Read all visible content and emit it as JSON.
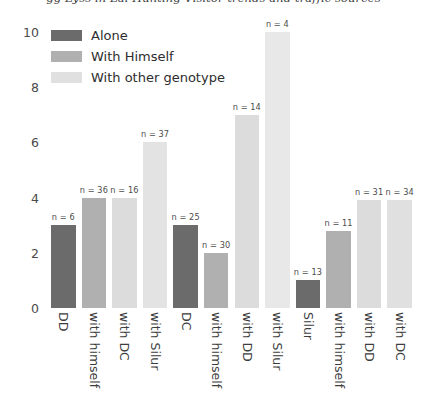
{
  "top_caption_sliver": "gg   Lyss in Lai Hunting Visitor trends and traffic sources",
  "legend": {
    "position": "upper-left",
    "entries": [
      {
        "label": "Alone",
        "color": "#6b6b6b"
      },
      {
        "label": "With Himself",
        "color": "#b0b0b0"
      },
      {
        "label": "With other genotype",
        "color": "#e0e0e0"
      }
    ]
  },
  "chart_data": {
    "type": "bar",
    "title": "",
    "xlabel": "",
    "ylabel": "",
    "ylim": [
      0,
      10.6
    ],
    "yticks": [
      "0",
      "2",
      "4",
      "6",
      "8",
      "10"
    ],
    "ytick_values": [
      0,
      2,
      4,
      6,
      8,
      10
    ],
    "grid": false,
    "categories": [
      "DD",
      "with himself",
      "with DC",
      "with Silur",
      "DC",
      "with himself",
      "with DD",
      "with Silur",
      "Silur",
      "with himself",
      "with DD",
      "with DC"
    ],
    "values": [
      3.0,
      4.0,
      4.0,
      6.0,
      3.0,
      2.0,
      7.0,
      10.0,
      1.0,
      2.8,
      3.9,
      3.9
    ],
    "bar_colors": [
      "#6b6b6b",
      "#b0b0b0",
      "#dcdcdc",
      "#e3e3e3",
      "#6b6b6b",
      "#b0b0b0",
      "#dcdcdc",
      "#e8e8e8",
      "#6b6b6b",
      "#b0b0b0",
      "#dcdcdc",
      "#e0e0e0"
    ],
    "annotations": [
      "n = 6",
      "n = 36",
      "n = 16",
      "n = 37",
      "n = 25",
      "n = 30",
      "n = 14",
      "n = 4",
      "n = 13",
      "n = 11",
      "n = 31",
      "n = 34"
    ],
    "n_values": [
      6,
      36,
      16,
      37,
      25,
      30,
      14,
      4,
      13,
      11,
      31,
      34
    ],
    "groups": [
      {
        "genotype": "DD",
        "indices": [
          0,
          1,
          2,
          3
        ]
      },
      {
        "genotype": "DC",
        "indices": [
          4,
          5,
          6,
          7
        ]
      },
      {
        "genotype": "Silur",
        "indices": [
          8,
          9,
          10,
          11
        ]
      }
    ]
  }
}
